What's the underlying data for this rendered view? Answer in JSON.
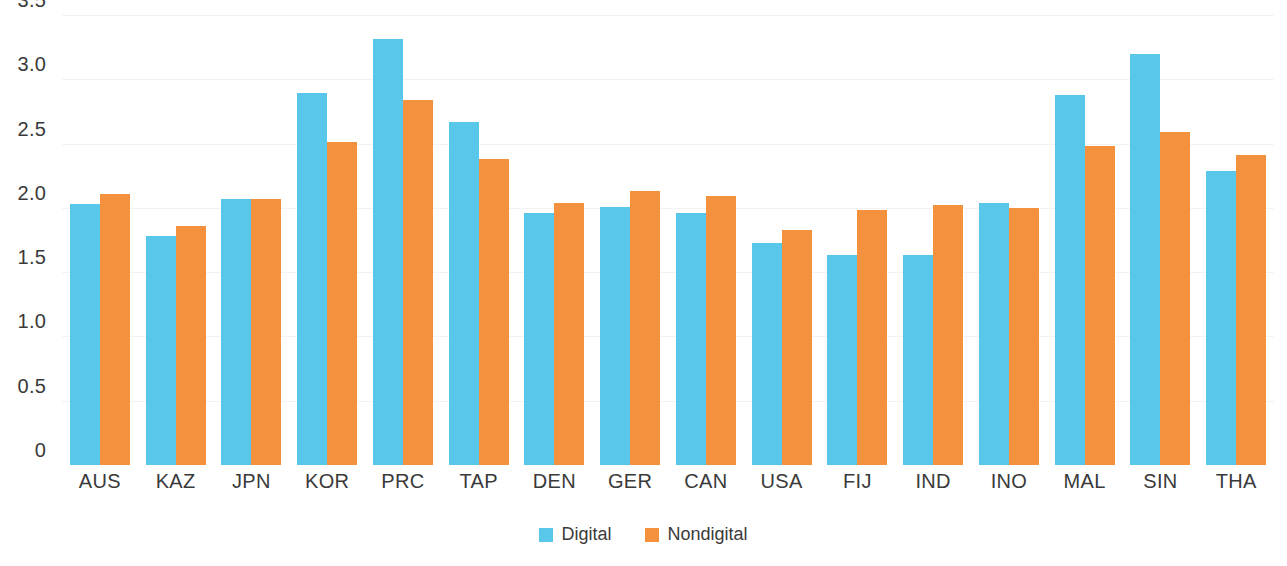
{
  "chart_data": {
    "type": "bar",
    "title": "",
    "subtitle": "",
    "xlabel": "",
    "ylabel": "",
    "ylim": [
      0,
      3.5
    ],
    "yticks": [
      "0",
      "0.5",
      "1.0",
      "1.5",
      "2.0",
      "2.5",
      "3.0",
      "3.5"
    ],
    "ytick_values": [
      0,
      0.5,
      1.0,
      1.5,
      2.0,
      2.5,
      3.0,
      3.5
    ],
    "grid": true,
    "legend_position": "bottom-center",
    "categories": [
      "AUS",
      "KAZ",
      "JPN",
      "KOR",
      "PRC",
      "TAP",
      "DEN",
      "GER",
      "CAN",
      "USA",
      "FIJ",
      "IND",
      "INO",
      "MAL",
      "SIN",
      "THA"
    ],
    "series": [
      {
        "name": "Digital",
        "color": "#59c7e9",
        "values": [
          2.03,
          1.78,
          2.07,
          2.89,
          3.31,
          2.67,
          1.96,
          2.01,
          1.96,
          1.73,
          1.63,
          1.63,
          2.04,
          2.88,
          3.2,
          2.29
        ]
      },
      {
        "name": "Nondigital",
        "color": "#f4913f",
        "values": [
          2.11,
          1.86,
          2.07,
          2.51,
          2.84,
          2.38,
          2.04,
          2.13,
          2.09,
          1.83,
          1.98,
          2.02,
          2.0,
          2.48,
          2.59,
          2.41
        ]
      }
    ]
  },
  "legend": {
    "items": [
      {
        "label": "Digital",
        "color": "#59c7e9"
      },
      {
        "label": "Nondigital",
        "color": "#f4913f"
      }
    ]
  },
  "colors": {
    "digital": "#59c7e9",
    "nondigital": "#f4913f",
    "grid": "#f2f2f3",
    "text": "#3a3a3a",
    "background": "#ffffff"
  }
}
